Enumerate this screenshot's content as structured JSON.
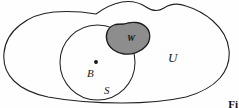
{
  "figure": {
    "background_color": "#fefefe",
    "stroke_color": "#222222"
  },
  "labels": {
    "universe": "U",
    "subset": "S",
    "point": "B",
    "region": "W"
  },
  "caption": {
    "text": "Fi"
  },
  "shapes": {
    "universe_name": "universe-outline",
    "subset_name": "subset-circle",
    "region_name": "region-blob",
    "point_name": "point-marker",
    "region_fill_color": "#8d8d8d",
    "region_stroke_color": "#1d1d1d",
    "point_color": "#111111"
  }
}
